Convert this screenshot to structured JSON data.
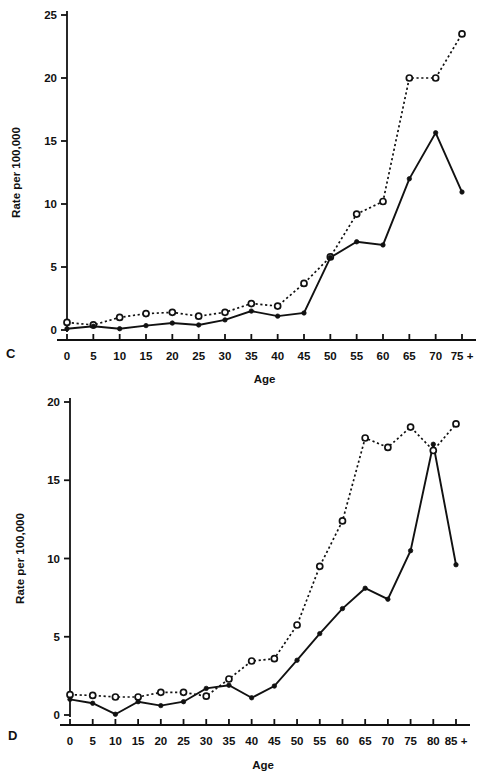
{
  "figure": {
    "panels": [
      {
        "letter": "C",
        "letter_name": "panel-label-c"
      },
      {
        "letter": "D",
        "letter_name": "panel-label-d"
      }
    ]
  },
  "chart_data": [
    {
      "type": "line",
      "panel": "C",
      "title": "",
      "xlabel": "Age",
      "ylabel": "Rate per 100,000",
      "categories": [
        "0",
        "5",
        "10",
        "15",
        "20",
        "25",
        "30",
        "35",
        "40",
        "45",
        "50",
        "55",
        "60",
        "65",
        "70",
        "75 +"
      ],
      "xticklabels": [
        "0",
        "5",
        "10",
        "15",
        "20",
        "25",
        "30",
        "35",
        "40",
        "45",
        "50",
        "55",
        "60",
        "65",
        "70",
        "75 +"
      ],
      "yticklabels": [
        "0",
        "5",
        "10",
        "15",
        "20",
        "25"
      ],
      "yticks": [
        0,
        5,
        10,
        15,
        20,
        25
      ],
      "ylim": [
        0,
        25
      ],
      "grid": false,
      "legend": "none",
      "series": [
        {
          "name": "dashed-open-circle",
          "marker": "open-circle",
          "linestyle": "dotted",
          "values": [
            0.6,
            0.4,
            1.0,
            1.3,
            1.4,
            1.1,
            1.4,
            2.1,
            1.9,
            3.7,
            5.8,
            9.2,
            10.2,
            20.0,
            20.0,
            23.5
          ]
        },
        {
          "name": "solid-filled-circle",
          "marker": "filled-circle",
          "linestyle": "solid",
          "values": [
            0.1,
            0.3,
            0.1,
            0.35,
            0.55,
            0.4,
            0.8,
            1.5,
            1.1,
            1.35,
            5.75,
            7.0,
            6.75,
            12.0,
            15.65,
            10.95
          ]
        }
      ]
    },
    {
      "type": "line",
      "panel": "D",
      "title": "",
      "xlabel": "Age",
      "ylabel": "Rate per 100,000",
      "categories": [
        "0",
        "5",
        "10",
        "15",
        "20",
        "25",
        "30",
        "35",
        "40",
        "45",
        "50",
        "55",
        "60",
        "65",
        "70",
        "75",
        "80",
        "85 +"
      ],
      "xticklabels": [
        "0",
        "5",
        "10",
        "15",
        "20",
        "25",
        "30",
        "35",
        "40",
        "45",
        "50",
        "55",
        "60",
        "65",
        "70",
        "75",
        "80",
        "85 +"
      ],
      "yticklabels": [
        "0",
        "5",
        "10",
        "15",
        "20"
      ],
      "yticks": [
        0,
        5,
        10,
        15,
        20
      ],
      "ylim": [
        0,
        20
      ],
      "grid": false,
      "legend": "none",
      "series": [
        {
          "name": "dashed-open-circle",
          "marker": "open-circle",
          "linestyle": "dotted",
          "values": [
            1.3,
            1.25,
            1.15,
            1.15,
            1.45,
            1.45,
            1.2,
            2.3,
            3.45,
            3.6,
            5.75,
            9.5,
            12.4,
            17.7,
            17.1,
            18.4,
            16.9,
            18.6
          ]
        },
        {
          "name": "solid-filled-circle",
          "marker": "filled-circle",
          "linestyle": "solid",
          "values": [
            1.0,
            0.75,
            0.05,
            0.85,
            0.6,
            0.85,
            1.7,
            1.9,
            1.1,
            1.85,
            3.5,
            5.2,
            6.8,
            8.1,
            7.4,
            10.5,
            17.3,
            9.6
          ]
        }
      ]
    }
  ]
}
